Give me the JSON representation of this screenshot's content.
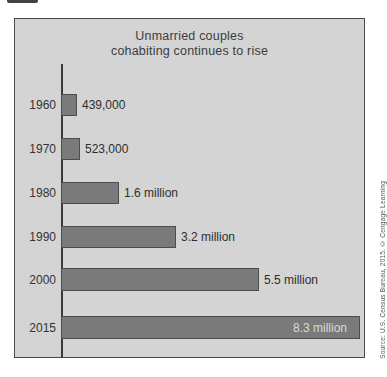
{
  "chart_data": {
    "type": "bar",
    "orientation": "horizontal",
    "title_line1": "Unmarried couples",
    "title_line2": "cohabiting continues to rise",
    "categories": [
      "1960",
      "1970",
      "1980",
      "1990",
      "2000",
      "2015"
    ],
    "values_millions": [
      0.439,
      0.523,
      1.6,
      3.2,
      5.5,
      8.3
    ],
    "value_labels": [
      "439,000",
      "523,000",
      "1.6 million",
      "3.2 million",
      "5.5 million",
      "8.3 million"
    ],
    "xlim_millions": [
      0,
      8.6
    ],
    "grid": false,
    "legend": "none",
    "last_label_inside_bar": true,
    "px_per_million": 36,
    "panel_background": "#d4d4d4",
    "bar_color": "#7a7a7a",
    "bar_border_color": "#4d4d4d",
    "axis_color": "#3a3a3a"
  },
  "source_note": "Source: U.S. Census Bureau, 2015. © Cengage Learning"
}
